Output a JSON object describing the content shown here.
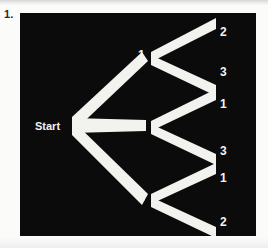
{
  "page": {
    "item_number": "1.",
    "background_color": "#fbfbfa"
  },
  "diagram": {
    "panel_color": "#0b0b0b",
    "branch_color": "#f2f2ef",
    "label_color": "#f2f2ef",
    "start_label": "Start",
    "type": "probability-tree-diagram",
    "stage1_labels": [
      "1",
      "2",
      "3"
    ],
    "stage2_groups": [
      {
        "parent": "1",
        "leaves": [
          "2",
          "3"
        ]
      },
      {
        "parent": "2",
        "leaves": [
          "1",
          "3"
        ]
      },
      {
        "parent": "3",
        "leaves": [
          "1",
          "2"
        ]
      }
    ],
    "labels": {
      "n1": "1",
      "n2": "2",
      "n3": "3",
      "l1a": "2",
      "l1b": "3",
      "l2a": "1",
      "l2b": "3",
      "l3a": "1",
      "l3b": "2"
    }
  }
}
